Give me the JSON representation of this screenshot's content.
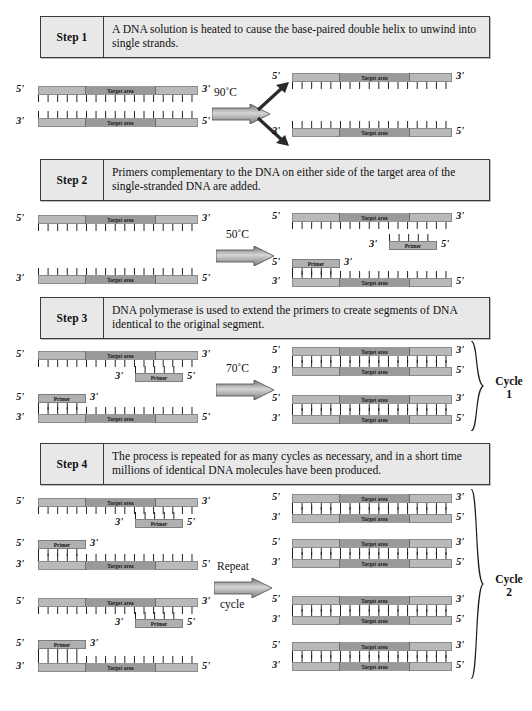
{
  "figure": {
    "labels": {
      "five_prime": "5'",
      "three_prime": "3'",
      "target_area": "Target area",
      "primer": "Primer"
    },
    "colors": {
      "strand_flank": "#b9b9b9",
      "strand_target": "#9a9a9a",
      "primer_fill": "#b0b0b0",
      "box_fill": "#e8e8e8",
      "box_border": "#3a3a3a",
      "tick": "#1a1a1a"
    }
  },
  "steps": [
    {
      "number": "Step 1",
      "text": "A DNA solution is heated to cause the base-paired double helix to unwind into single strands.",
      "condition": "90˚C"
    },
    {
      "number": "Step 2",
      "text": "Primers complementary to the DNA on either side of the target area of the single-stranded DNA are added.",
      "condition": "50˚C"
    },
    {
      "number": "Step 3",
      "text": "DNA polymerase is used to extend the primers to create segments of DNA identical to the original segment.",
      "condition": "70˚C"
    },
    {
      "number": "Step 4",
      "text": "The process is repeated for as many cycles as necessary, and in a short time millions of identical DNA molecules have been produced.",
      "condition_line1": "Repeat",
      "condition_line2": "cycle"
    }
  ],
  "cycles": [
    {
      "name": "Cycle",
      "number": "1"
    },
    {
      "name": "Cycle",
      "number": "2"
    }
  ]
}
